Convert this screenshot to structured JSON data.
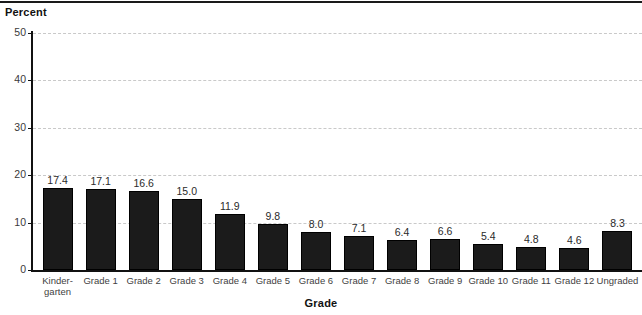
{
  "chart_data": {
    "type": "bar",
    "title": "",
    "xlabel": "Grade",
    "ylabel": "Percent",
    "categories": [
      "Kinder-\ngarten",
      "Grade 1",
      "Grade 2",
      "Grade 3",
      "Grade 4",
      "Grade 5",
      "Grade 6",
      "Grade 7",
      "Grade 8",
      "Grade 9",
      "Grade 10",
      "Grade 11",
      "Grade 12",
      "Ungraded"
    ],
    "values": [
      17.4,
      17.1,
      16.6,
      15.0,
      11.9,
      9.8,
      8.0,
      7.1,
      6.4,
      6.6,
      5.4,
      4.8,
      4.6,
      8.3
    ],
    "value_labels": [
      "17.4",
      "17.1",
      "16.6",
      "15.0",
      "11.9",
      "9.8",
      "8.0",
      "7.1",
      "6.4",
      "6.6",
      "5.4",
      "4.8",
      "4.6",
      "8.3"
    ],
    "ylim": [
      0,
      50
    ],
    "yticks": [
      0,
      10,
      20,
      30,
      40,
      50
    ],
    "ytick_labels": [
      "0",
      "10",
      "20",
      "30",
      "40",
      "50"
    ],
    "grid": "horizontal-dashed",
    "legend": "none",
    "bar_color": "#1b1b1b",
    "grid_color": "#c9c9c9",
    "axis_color": "#111111"
  }
}
